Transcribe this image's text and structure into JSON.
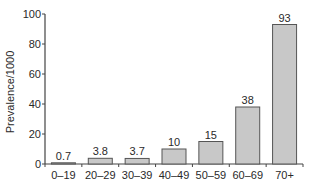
{
  "chart_data": {
    "type": "bar",
    "title": "",
    "xlabel": "",
    "ylabel": "Prevalence/1000",
    "categories": [
      "0–19",
      "20–29",
      "30–39",
      "40–49",
      "50–59",
      "60–69",
      "70+"
    ],
    "values": [
      0.7,
      3.8,
      3.7,
      10,
      15,
      38,
      93
    ],
    "value_labels": [
      "0.7",
      "3.8",
      "3.7",
      "10",
      "15",
      "38",
      "93"
    ],
    "ylim": [
      0,
      100
    ],
    "yticks": [
      0,
      20,
      40,
      60,
      80,
      100
    ],
    "grid": false,
    "legend": null,
    "bar_color": "#c8c8c8",
    "bar_edge_color": "#555555"
  }
}
